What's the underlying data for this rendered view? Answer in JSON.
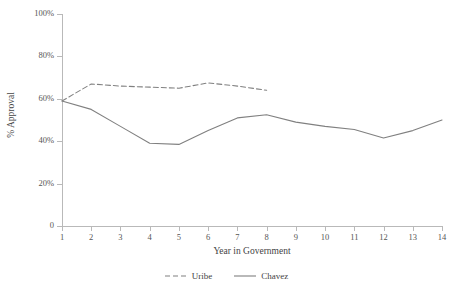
{
  "chart_data": {
    "type": "line",
    "title": "",
    "xlabel": "Year in Government",
    "ylabel": "% Approval",
    "x": [
      1,
      2,
      3,
      4,
      5,
      6,
      7,
      8,
      9,
      10,
      11,
      12,
      13,
      14
    ],
    "xticklabels": [
      "1",
      "2",
      "3",
      "4",
      "5",
      "6",
      "7",
      "8",
      "9",
      "10",
      "11",
      "12",
      "13",
      "14"
    ],
    "yticklabels": [
      "0",
      "20%",
      "40%",
      "60%",
      "80%",
      "100%"
    ],
    "ytickvalues": [
      0,
      20,
      40,
      60,
      80,
      100
    ],
    "xlim": [
      1,
      14
    ],
    "ylim": [
      0,
      100
    ],
    "grid": false,
    "legend_position": "bottom-center",
    "series": [
      {
        "name": "Uribe",
        "style": "dashed",
        "color": "#808080",
        "x": [
          1,
          2,
          3,
          4,
          5,
          6,
          7,
          8
        ],
        "values": [
          59,
          67,
          66,
          65.5,
          65,
          67.5,
          66,
          64
        ]
      },
      {
        "name": "Chavez",
        "style": "solid",
        "color": "#808080",
        "x": [
          1,
          2,
          3,
          4,
          5,
          6,
          7,
          8,
          9,
          10,
          11,
          12,
          13,
          14
        ],
        "values": [
          59,
          55,
          47,
          39,
          38.5,
          45,
          51,
          52.5,
          49,
          47,
          45.5,
          41.5,
          45,
          50
        ]
      }
    ]
  },
  "legend": {
    "entries": [
      {
        "label": "Uribe"
      },
      {
        "label": "Chavez"
      }
    ]
  }
}
